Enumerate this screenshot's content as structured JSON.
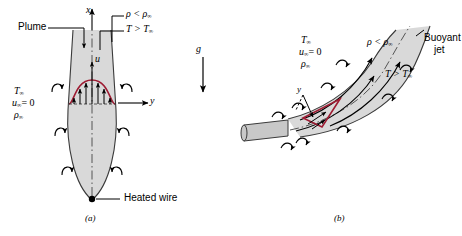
{
  "figure": {
    "colors": {
      "plume_fill": "#d9d9d9",
      "plume_edge": "#3a3a3a",
      "profile_red": "#9e1b32",
      "arrow_black": "#000000",
      "pipe_fill": "#c8c8c8",
      "background": "#ffffff"
    }
  },
  "panel_a": {
    "caption": "(a)",
    "plume_label": "Plume",
    "heated_wire_label": "Heated wire",
    "axis_x": "x",
    "axis_y": "y",
    "velocity_label": "u",
    "density_condition": "ρ < ρ",
    "density_sub": "∞",
    "temperature_condition": "T > T",
    "temperature_sub": "∞",
    "ambient": {
      "temperature": "T",
      "temperature_sub": "∞",
      "velocity": "u",
      "velocity_sub": "∞",
      "velocity_value": "= 0",
      "density": "ρ",
      "density_sub": "∞"
    }
  },
  "gravity": {
    "label": "g"
  },
  "panel_b": {
    "caption": "(b)",
    "buoyant_jet_label_line1": "Buoyant",
    "buoyant_jet_label_line2": "jet",
    "axis_y": "y",
    "density_condition": "ρ < ρ",
    "density_sub": "∞",
    "temperature_condition": "T > T",
    "temperature_sub": "∞",
    "ambient": {
      "temperature": "T",
      "temperature_sub": "∞",
      "velocity": "u",
      "velocity_sub": "∞",
      "velocity_value": "= 0",
      "density": "ρ",
      "density_sub": "∞"
    }
  }
}
